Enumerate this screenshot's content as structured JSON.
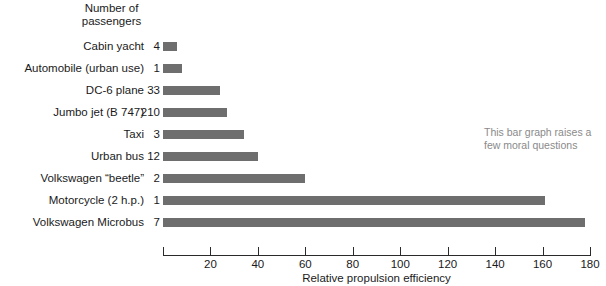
{
  "header": {
    "line1": "Number of",
    "line2": "passengers"
  },
  "annotation": {
    "line1": "This bar graph raises a",
    "line2": "few moral questions"
  },
  "chart_data": {
    "type": "bar",
    "orientation": "horizontal",
    "title": "",
    "xlabel": "Relative propulsion efficiency",
    "ylabel": "",
    "xlim": [
      0,
      180
    ],
    "xticks": [
      0,
      20,
      40,
      60,
      80,
      100,
      120,
      140,
      160,
      180
    ],
    "xtick_labels": [
      "",
      "20",
      "40",
      "60",
      "80",
      "100",
      "120",
      "140",
      "160",
      "180"
    ],
    "grid": false,
    "legend": null,
    "bar_color": "#6e6e6e",
    "passengers_header": [
      "Number of",
      "passengers"
    ],
    "categories": [
      "Cabin yacht",
      "Automobile (urban use)",
      "DC-6 plane",
      "Jumbo jet (B 747)",
      "Taxi",
      "Urban bus",
      "Volkswagen “beetle”",
      "Motorcycle (2 h.p.)",
      "Volkswagen Microbus"
    ],
    "passengers": [
      "4",
      "1",
      "33",
      "210",
      "3",
      "12",
      "2",
      "1",
      "7"
    ],
    "values": [
      6,
      8,
      24,
      27,
      34,
      40,
      60,
      161,
      178
    ],
    "annotation_text": "This bar graph raises a few moral questions"
  }
}
